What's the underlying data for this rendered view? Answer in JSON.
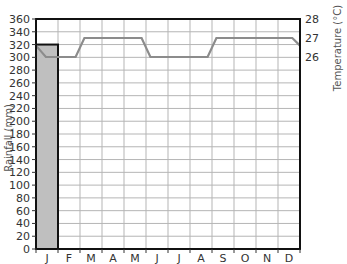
{
  "chart_data": {
    "type": "bar+line",
    "title": "",
    "categories": [
      "J",
      "F",
      "M",
      "A",
      "M",
      "J",
      "J",
      "A",
      "S",
      "O",
      "N",
      "D"
    ],
    "series": [
      {
        "name": "Rainfall (mm)",
        "type": "bar",
        "axis": "left",
        "values": [
          320,
          0,
          0,
          0,
          0,
          0,
          0,
          0,
          0,
          0,
          0,
          0
        ],
        "color": "#bfbfbf"
      },
      {
        "name": "Temperature (°C)",
        "type": "line",
        "axis": "right",
        "values": [
          26,
          26,
          27,
          27,
          27,
          26,
          26,
          26,
          27,
          27,
          27,
          27
        ],
        "color": "#8c8c8c",
        "start_value": 26.6,
        "end_value": 26.6
      }
    ],
    "xlabel": "",
    "ylabel": "Rainfall (mm)",
    "y2label": "Temperature (°C)",
    "ylim": [
      0,
      360
    ],
    "y2lim": [
      26,
      28
    ],
    "yticks": [
      0,
      20,
      40,
      60,
      80,
      100,
      120,
      140,
      160,
      180,
      200,
      220,
      240,
      260,
      280,
      300,
      320,
      340,
      360
    ],
    "y2ticks": [
      26,
      27,
      28
    ],
    "grid": true
  },
  "labels": {
    "ylabel": "Rainfall (mm)",
    "y2label": "Temperature (°C)"
  }
}
